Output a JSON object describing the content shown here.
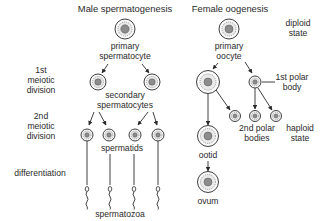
{
  "diagram": {
    "male": {
      "title": "Male spermatogenesis",
      "primary_label_1": "primary",
      "primary_label_2": "spermatocyte",
      "secondary_label_1": "secondary",
      "secondary_label_2": "spermatocytes",
      "spermatids_label": "spermatids",
      "spermatozoa_label": "spermatozoa"
    },
    "female": {
      "title": "Female oogenesis",
      "primary_label_1": "primary",
      "primary_label_2": "oocyte",
      "first_polar_1": "1st polar",
      "first_polar_2": "body",
      "second_polar_1": "2nd polar",
      "second_polar_2": "bodies",
      "ootid_label": "ootid",
      "ovum_label": "ovum"
    },
    "stages": {
      "meiosis1_1": "1st",
      "meiosis1_2": "meiotic",
      "meiosis1_3": "division",
      "meiosis2_1": "2nd",
      "meiosis2_2": "meiotic",
      "meiosis2_3": "division",
      "differentiation": "differentiation"
    },
    "states": {
      "diploid_1": "diploid",
      "diploid_2": "state",
      "haploid_1": "haploid",
      "haploid_2": "state"
    }
  }
}
